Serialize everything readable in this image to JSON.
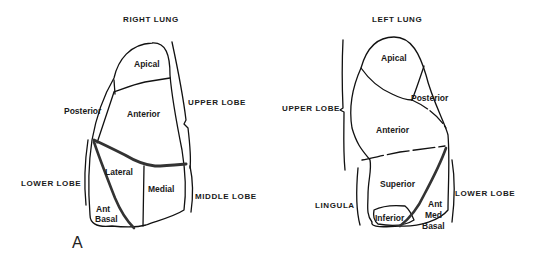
{
  "panel_label": "A",
  "right_lung": {
    "title": "RIGHT LUNG",
    "lobes": {
      "upper": "UPPER LOBE",
      "middle": "MIDDLE LOBE",
      "lower": "LOWER LOBE"
    },
    "segments": {
      "apical": "Apical",
      "posterior": "Posterior",
      "anterior": "Anterior",
      "lateral": "Lateral",
      "medial": "Medial",
      "ant_basal_1": "Ant",
      "ant_basal_2": "Basal"
    }
  },
  "left_lung": {
    "title": "LEFT LUNG",
    "lobes": {
      "upper": "UPPER LOBE",
      "lingula": "LINGULA",
      "lower": "LOWER LOBE"
    },
    "segments": {
      "apical": "Apical",
      "posterior": "Posterior",
      "anterior": "Anterior",
      "superior": "Superior",
      "inferior": "Inferior",
      "ant_med_basal_1": "Ant",
      "ant_med_basal_2": "Med",
      "ant_med_basal_3": "Basal"
    }
  }
}
